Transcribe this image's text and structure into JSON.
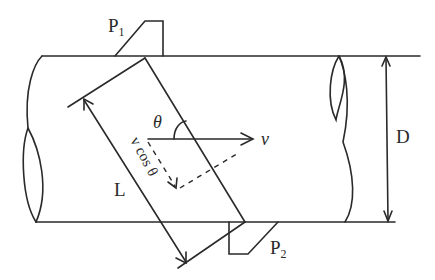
{
  "diagram": {
    "type": "ultrasonic flowmeter transit-time schematic (pipe section)",
    "labels": {
      "transducer_top": "P",
      "transducer_top_sub": "1",
      "transducer_bottom": "P",
      "transducer_bottom_sub": "2",
      "angle": "θ",
      "velocity": "v",
      "velocity_component": "v cos θ",
      "path_length": "L",
      "diameter": "D"
    },
    "colors": {
      "line": "#2a2a2a",
      "background": "#ffffff"
    }
  }
}
